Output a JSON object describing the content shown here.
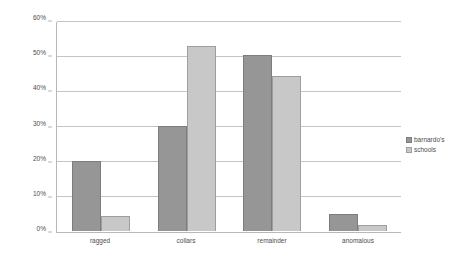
{
  "chart_data": {
    "type": "bar",
    "title": "",
    "subtitle": "",
    "xlabel": "",
    "ylabel": "",
    "categories": [
      "ragged",
      "collars",
      "remainder",
      "anomalous"
    ],
    "series": [
      {
        "name": "barnardo's",
        "color": "#969696",
        "values": [
          20.2,
          30.1,
          50.4,
          4.8
        ]
      },
      {
        "name": "schools",
        "color": "#c8c8c8",
        "values": [
          4.2,
          53.0,
          44.4,
          1.6
        ]
      }
    ],
    "ylim": [
      0,
      60
    ],
    "yticks": [
      0,
      10,
      20,
      30,
      40,
      50,
      60
    ],
    "ytick_labels": [
      "0%",
      "10%",
      "20%",
      "30%",
      "40%",
      "50%",
      "60%"
    ],
    "grid": true,
    "grid_axis": "y",
    "legend_position": "right",
    "value_suffix": "%"
  },
  "colors": {
    "series_0": "#969696",
    "series_1": "#c8c8c8",
    "gridline": "#c4c4c4",
    "axis": "#b8b8b8",
    "text": "#4d4d4d",
    "background": "#ffffff"
  }
}
